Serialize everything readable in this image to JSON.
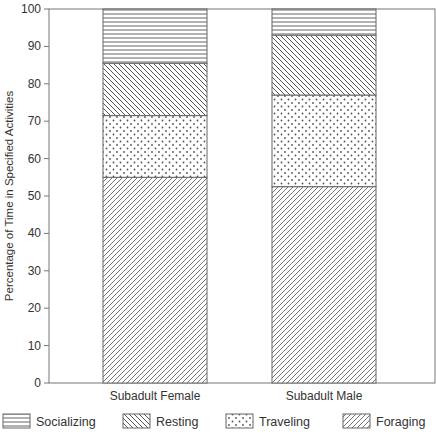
{
  "chart_data": {
    "type": "bar",
    "stacked": true,
    "title": "",
    "xlabel": "",
    "ylabel": "Percentage of Time in Specified Activities",
    "ylim": [
      0,
      100
    ],
    "yticks": [
      0,
      10,
      20,
      30,
      40,
      50,
      60,
      70,
      80,
      90,
      100
    ],
    "grid": false,
    "legend_position": "bottom",
    "categories": [
      "Subadult Female",
      "Subadult Male"
    ],
    "series": [
      {
        "name": "Foraging",
        "pattern": "diagonal-forward",
        "values": [
          55,
          52.5
        ]
      },
      {
        "name": "Traveling",
        "pattern": "dots",
        "values": [
          16.5,
          24.5
        ]
      },
      {
        "name": "Resting",
        "pattern": "diagonal-backward",
        "values": [
          14,
          16
        ]
      },
      {
        "name": "Socializing",
        "pattern": "horizontal-lines",
        "values": [
          14.5,
          7
        ]
      }
    ],
    "legend_order": [
      "Socializing",
      "Resting",
      "Traveling",
      "Foraging"
    ]
  },
  "colors": {
    "ink": "#555555",
    "axis": "#777777",
    "background": "#ffffff"
  }
}
